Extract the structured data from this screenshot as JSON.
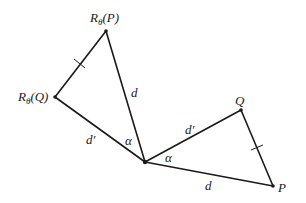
{
  "diagram": {
    "type": "rotation-geometry",
    "background": "#ffffff",
    "ink_color": "#1a1a1a",
    "points": {
      "center": {
        "x": 145,
        "y": 162
      },
      "P": {
        "x": 273,
        "y": 186,
        "label": "P"
      },
      "Q": {
        "x": 241,
        "y": 110,
        "label": "Q"
      },
      "RP": {
        "x": 106,
        "y": 31,
        "label_base": "R",
        "label_sub": "θ",
        "label_arg": "(P)"
      },
      "RQ": {
        "x": 55,
        "y": 97,
        "label_base": "R",
        "label_sub": "θ",
        "label_arg": "(Q)"
      }
    },
    "edges": [
      {
        "from": "center",
        "to": "P",
        "label": "d"
      },
      {
        "from": "center",
        "to": "Q",
        "label": "d′"
      },
      {
        "from": "Q",
        "to": "P",
        "label": "",
        "tick": true
      },
      {
        "from": "center",
        "to": "RP",
        "label": "d"
      },
      {
        "from": "center",
        "to": "RQ",
        "label": "d′"
      },
      {
        "from": "RQ",
        "to": "RP",
        "label": "",
        "tick": true
      }
    ],
    "angles": [
      {
        "label": "α",
        "between": [
          "P",
          "Q"
        ]
      },
      {
        "label": "α",
        "between": [
          "RP",
          "RQ"
        ]
      }
    ],
    "labels": {
      "P": "P",
      "Q": "Q",
      "RP_base": "R",
      "RP_sub": "θ",
      "RP_arg": "(P)",
      "RQ_base": "R",
      "RQ_sub": "θ",
      "RQ_arg": "(Q)",
      "d_lower": "d",
      "d_upper": "d",
      "dprime_right": "d′",
      "dprime_left": "d′",
      "alpha_right": "α",
      "alpha_left": "α"
    }
  }
}
